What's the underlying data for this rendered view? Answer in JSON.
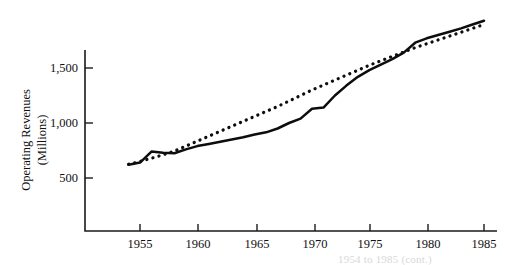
{
  "chart_data": {
    "type": "line",
    "title": "",
    "subtitle": "",
    "xlabel": "",
    "ylabel": "Operating Revenues (Millions)",
    "ylabel_line1": "Operating Revenues",
    "ylabel_line2": "(Millions)",
    "grid": false,
    "legend": false,
    "legend_position": "none",
    "xlim": [
      1953,
      1986
    ],
    "ylim": [
      0,
      2000
    ],
    "xticks": [
      1955,
      1960,
      1965,
      1970,
      1975,
      1980,
      1985
    ],
    "xtick_labels": [
      "1955",
      "1960",
      "1965",
      "1970",
      "1975",
      "1980",
      "1985"
    ],
    "yticks": [
      500,
      1000,
      1500
    ],
    "ytick_labels": [
      "500",
      "1,000",
      "1,500"
    ],
    "x": [
      1954,
      1955,
      1956,
      1957,
      1958,
      1959,
      1960,
      1961,
      1962,
      1963,
      1964,
      1965,
      1966,
      1967,
      1968,
      1969,
      1970,
      1971,
      1972,
      1973,
      1974,
      1975,
      1976,
      1977,
      1978,
      1979,
      1980,
      1981,
      1982,
      1983,
      1984,
      1985
    ],
    "series": [
      {
        "name": "Operating Revenues (actual)",
        "style": "solid",
        "color": "#0d0d0d",
        "values": [
          620,
          640,
          740,
          730,
          725,
          760,
          790,
          810,
          830,
          850,
          870,
          895,
          915,
          950,
          1000,
          1040,
          1130,
          1140,
          1250,
          1340,
          1420,
          1480,
          1530,
          1580,
          1640,
          1730,
          1770,
          1800,
          1830,
          1860,
          1895,
          1930
        ]
      },
      {
        "name": "Trend line",
        "style": "dotted",
        "color": "#0d0d0d",
        "values": [
          625,
          650,
          680,
          710,
          745,
          790,
          835,
          880,
          925,
          970,
          1015,
          1060,
          1105,
          1150,
          1200,
          1250,
          1300,
          1345,
          1390,
          1435,
          1480,
          1525,
          1565,
          1605,
          1645,
          1685,
          1720,
          1755,
          1790,
          1825,
          1860,
          1895
        ]
      }
    ],
    "annotations": [],
    "caption_fragment": "1954 to 1985 (cont.)"
  },
  "figure": {
    "axis_color": "#1a1a1a",
    "background": "#ffffff"
  }
}
